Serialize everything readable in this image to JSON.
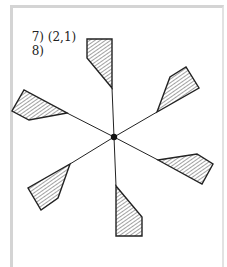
{
  "exercise": {
    "item7": {
      "number": "7)",
      "answer": "(2,1)"
    },
    "item8": {
      "number": "8)"
    }
  },
  "figure": {
    "center": [
      114,
      137
    ],
    "blade_count": 6,
    "stroke_color": "#222222",
    "hatch_color": "#555555"
  }
}
